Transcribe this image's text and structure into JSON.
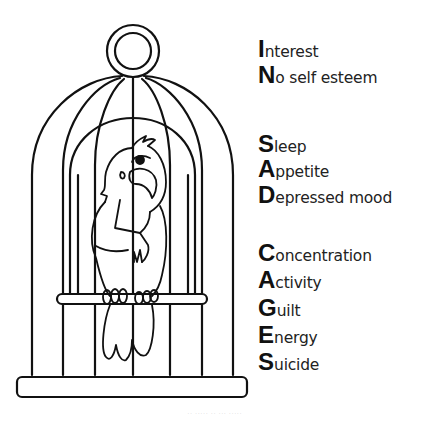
{
  "illustration": {
    "subject": "parrot in birdcage",
    "stroke_color": "#111111",
    "background": "#ffffff"
  },
  "mnemonic": {
    "groups": [
      {
        "name": "IN",
        "items": [
          {
            "letter": "I",
            "rest": "nterest",
            "word": "Interest"
          },
          {
            "letter": "N",
            "rest": "o self esteem",
            "word": "No self esteem"
          }
        ]
      },
      {
        "name": "SAD",
        "items": [
          {
            "letter": "S",
            "rest": "leep",
            "word": "Sleep"
          },
          {
            "letter": "A",
            "rest": "ppetite",
            "word": "Appetite"
          },
          {
            "letter": "D",
            "rest": "epressed mood",
            "word": "Depressed mood"
          }
        ]
      },
      {
        "name": "CAGES",
        "items": [
          {
            "letter": "C",
            "rest": "oncentration",
            "word": "Concentration"
          },
          {
            "letter": "A",
            "rest": "ctivity",
            "word": "Activity"
          },
          {
            "letter": "G",
            "rest": "uilt",
            "word": "Guilt"
          },
          {
            "letter": "E",
            "rest": "nergy",
            "word": "Energy"
          },
          {
            "letter": "S",
            "rest": "uicide",
            "word": "Suicide"
          }
        ]
      }
    ]
  },
  "footer": {
    "text": "·· ····· ·· ··· ·····"
  }
}
